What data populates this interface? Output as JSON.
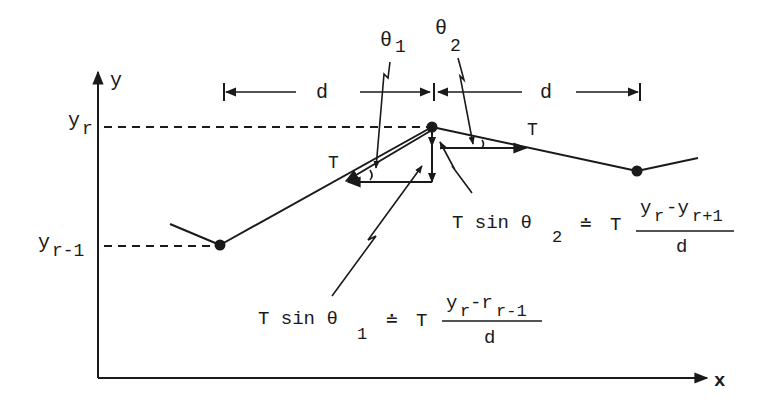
{
  "figure": {
    "type": "string tension force diagram",
    "axes": {
      "y_label": "y",
      "x_label": "x"
    },
    "levels": {
      "y_r": {
        "base": "y",
        "sub": "r"
      },
      "y_r_minus_1": {
        "base": "y",
        "sub": "r-1"
      }
    },
    "dimension_labels": {
      "left_d": "d",
      "right_d": "d"
    },
    "angles": {
      "theta1": {
        "base": "θ",
        "sub": "1"
      },
      "theta2": {
        "base": "θ",
        "sub": "2"
      }
    },
    "tension_labels": {
      "left": "T",
      "right": "T"
    },
    "equations": {
      "eq2": {
        "lhs": "T sin θ",
        "lhs_sub": "2",
        "approx": "≐",
        "coef": "T",
        "num_a": "y",
        "num_a_sub": "r",
        "num_op": "-y",
        "num_b_sub": "r+1",
        "den": "d"
      },
      "eq1": {
        "lhs": "T sin θ",
        "lhs_sub": "1",
        "approx": "≐",
        "coef": "T",
        "num_a": "y",
        "num_a_sub": "r",
        "num_op": "-r",
        "num_b_sub": "r-1",
        "den": "d"
      }
    },
    "colors": {
      "ink": "#1a1a1a",
      "background": "#ffffff"
    }
  }
}
